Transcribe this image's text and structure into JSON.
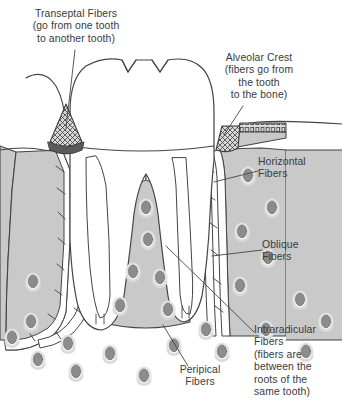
{
  "diagram": {
    "background_color": "#ffffff",
    "ink_color": "#3a3a3a",
    "text_color": "#3a3a3a",
    "bone_fill": "#c9c9c9",
    "pdl_fill": "#ffffff",
    "tooth_fill": "#ffffff",
    "marrow_fill": "#8c8c8c",
    "marrow_outline": "#e8e8e8",
    "crest_hatch_color": "#4a4a4a"
  },
  "labels": [
    {
      "id": "transeptal",
      "name": "Transeptal Fibers",
      "text": "Transeptal Fibers\n(go from one tooth\nto another tooth)",
      "align": "center",
      "x": 12,
      "y": 8,
      "width": 128,
      "leader": {
        "from_x": 75,
        "from_y": 50,
        "to_x": 66,
        "to_y": 128
      }
    },
    {
      "id": "alveolar-crest",
      "name": "Alveolar Crest",
      "text": "Alveolar Crest\n(fibers go from\nthe tooth\nto the bone)",
      "align": "center",
      "x": 203,
      "y": 52,
      "width": 112,
      "leader": {
        "from_x": 243,
        "from_y": 106,
        "to_x": 224,
        "to_y": 135
      }
    },
    {
      "id": "horizontal",
      "name": "Horizontal Fibers",
      "text": "Horizontal\nFibers",
      "align": "left",
      "x": 258,
      "y": 156,
      "width": 78,
      "leader": {
        "from_x": 258,
        "from_y": 171,
        "to_x": 214,
        "to_y": 182
      }
    },
    {
      "id": "oblique",
      "name": "Oblique Fibers",
      "text": "Oblique\nFibers",
      "align": "left",
      "x": 262,
      "y": 239,
      "width": 72,
      "leader": {
        "from_x": 262,
        "from_y": 250,
        "to_x": 212,
        "to_y": 256
      }
    },
    {
      "id": "intraradicular",
      "name": "Intraradicular Fibers",
      "text": "Intraradicular\nFibers\n(fibers are\nbetween the\nroots of the\nsame tooth)",
      "align": "left",
      "x": 254,
      "y": 324,
      "width": 86,
      "leader": {
        "from_x": 254,
        "from_y": 332,
        "to_x": 166,
        "to_y": 246
      }
    },
    {
      "id": "peripical",
      "name": "Peripical Fibers",
      "text": "Peripical\nFibers",
      "align": "center",
      "x": 160,
      "y": 364,
      "width": 80,
      "leader": {
        "from_x": 188,
        "from_y": 366,
        "to_x": 163,
        "to_y": 325
      }
    }
  ],
  "structures": [
    {
      "id": "crown",
      "name": "tooth-crown",
      "description": "three-cusp molar crown with two V grooves"
    },
    {
      "id": "gingiva-left",
      "name": "gingiva-left",
      "description": "left gum contour arching to adjacent tooth"
    },
    {
      "id": "gingiva-right",
      "name": "gingiva-right",
      "description": "right gum contour"
    },
    {
      "id": "root-mesial",
      "name": "root-mesial",
      "description": "left root of molar"
    },
    {
      "id": "root-distal",
      "name": "root-distal",
      "description": "right root of molar"
    },
    {
      "id": "bone-left",
      "name": "alveolar-bone-left",
      "description": "alveolar bone left of mesial root"
    },
    {
      "id": "bone-septum",
      "name": "interradicular-septum",
      "description": "bone septum between the two roots"
    },
    {
      "id": "bone-right",
      "name": "alveolar-bone-right",
      "description": "alveolar bone right of distal root"
    },
    {
      "id": "pdl",
      "name": "periodontal-ligament",
      "description": "ligament space with diagonal fiber bands"
    },
    {
      "id": "crest-right",
      "name": "alveolar-crest-hatch",
      "description": "cross-hatched crest fiber band, right"
    },
    {
      "id": "crest-left",
      "name": "transeptal-hatch",
      "description": "cross-hatched transeptal fiber triangle, left"
    },
    {
      "id": "marrow",
      "name": "marrow-spaces",
      "description": "gray oval marrow spaces within bone"
    }
  ]
}
